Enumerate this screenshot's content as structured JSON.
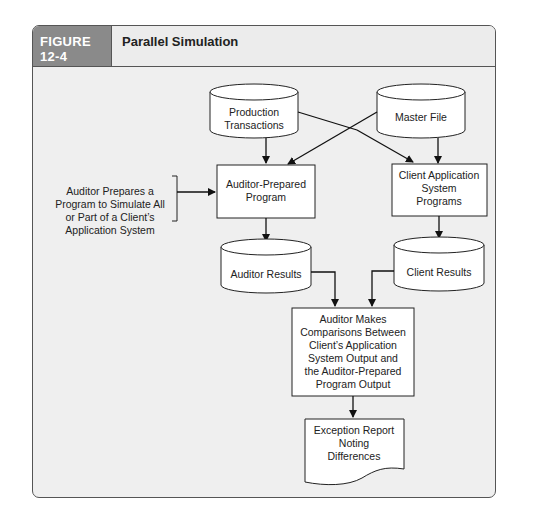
{
  "figure": {
    "number_label": "FIGURE 12-4",
    "title": "Parallel Simulation"
  },
  "diagram": {
    "nodes": {
      "production_transactions": {
        "type": "database",
        "lines": [
          "Production",
          "Transactions"
        ]
      },
      "master_file": {
        "type": "database",
        "lines": [
          "Master File"
        ]
      },
      "auditor_prepared_program": {
        "type": "process",
        "lines": [
          "Auditor-Prepared",
          "Program"
        ]
      },
      "client_application_programs": {
        "type": "process",
        "lines": [
          "Client Application",
          "System",
          "Programs"
        ]
      },
      "auditor_results": {
        "type": "database",
        "lines": [
          "Auditor Results"
        ]
      },
      "client_results": {
        "type": "database",
        "lines": [
          "Client Results"
        ]
      },
      "comparison": {
        "type": "process",
        "lines": [
          "Auditor Makes",
          "Comparisons Between",
          "Client’s Application",
          "System Output and",
          "the Auditor-Prepared",
          "Program Output"
        ]
      },
      "exception_report": {
        "type": "document",
        "lines": [
          "Exception Report",
          "Noting",
          "Differences"
        ]
      }
    },
    "annotation": {
      "lines": [
        "Auditor Prepares a",
        "Program to Simulate All",
        "or Part of a Client’s",
        "Application System"
      ]
    },
    "edges": [
      [
        "production_transactions",
        "auditor_prepared_program"
      ],
      [
        "production_transactions",
        "client_application_programs"
      ],
      [
        "master_file",
        "auditor_prepared_program"
      ],
      [
        "master_file",
        "client_application_programs"
      ],
      [
        "annotation",
        "auditor_prepared_program"
      ],
      [
        "auditor_prepared_program",
        "auditor_results"
      ],
      [
        "client_application_programs",
        "client_results"
      ],
      [
        "auditor_results",
        "comparison"
      ],
      [
        "client_results",
        "comparison"
      ],
      [
        "comparison",
        "exception_report"
      ]
    ]
  }
}
